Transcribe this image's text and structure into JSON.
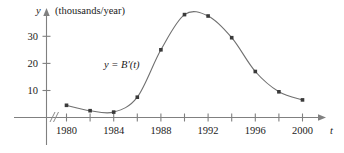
{
  "chart_data": {
    "type": "line",
    "title": "",
    "subtitle": "",
    "xlabel": "t",
    "ylabel": "y",
    "y_unit_label": "(thousands/year)",
    "curve_label": "y = B′(t)",
    "grid": false,
    "legend_position": "none",
    "axis_break": true,
    "xlim": [
      1978,
      2001
    ],
    "ylim": [
      0,
      40
    ],
    "x_tick_labels": [
      "1980",
      "1984",
      "1988",
      "1992",
      "1996",
      "2000"
    ],
    "x_labeled_ticks": [
      1980,
      1984,
      1988,
      1992,
      1996,
      2000
    ],
    "x_all_ticks": [
      1980,
      1982,
      1984,
      1986,
      1988,
      1990,
      1992,
      1994,
      1996,
      1998,
      2000
    ],
    "y_tick_labels": [
      "10",
      "20",
      "30"
    ],
    "y_ticks": [
      10,
      20,
      30
    ],
    "x": [
      1980,
      1982,
      1984,
      1986,
      1988,
      1990,
      1992,
      1994,
      1996,
      1998,
      2000
    ],
    "values": [
      4.5,
      2.5,
      2.0,
      7.5,
      25.0,
      38.0,
      37.5,
      29.5,
      17.0,
      9.5,
      6.5
    ],
    "series": [
      {
        "name": "y = B′(t)",
        "values": [
          4.5,
          2.5,
          2.0,
          7.5,
          25.0,
          38.0,
          37.5,
          29.5,
          17.0,
          9.5,
          6.5
        ]
      }
    ],
    "colors": {
      "curve": "#707070",
      "marker": "#3a3a3a",
      "axis": "#808080",
      "text": "#1a1a1a",
      "background": "#ffffff"
    }
  },
  "axes": {
    "y_name": "y",
    "y_unit": "(thousands/year)",
    "x_name": "t"
  },
  "annotations": {
    "curve_equation": "y = B′(t)"
  },
  "ticks": {
    "y": [
      {
        "label": "10",
        "value": 10
      },
      {
        "label": "20",
        "value": 20
      },
      {
        "label": "30",
        "value": 30
      }
    ],
    "x": [
      {
        "label": "1980",
        "value": 1980
      },
      {
        "label": "1984",
        "value": 1984
      },
      {
        "label": "1988",
        "value": 1988
      },
      {
        "label": "1992",
        "value": 1992
      },
      {
        "label": "1996",
        "value": 1996
      },
      {
        "label": "2000",
        "value": 2000
      }
    ]
  }
}
